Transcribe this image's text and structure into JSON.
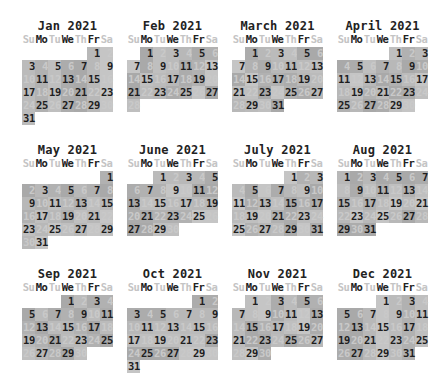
{
  "year": 2021,
  "weekday_labels": [
    "Su",
    "Mo",
    "Tu",
    "We",
    "Th",
    "Fr",
    "Sa"
  ],
  "weekday_emphasis": [
    false,
    true,
    false,
    true,
    false,
    true,
    false
  ],
  "colors": {
    "odd_day_text": "#1e1e1e",
    "even_day_text": "#c9c9c9",
    "cell_shades": [
      "#a9a9a9",
      "#b1b1b1",
      "#b8b8b8",
      "#bfbfbf",
      "#c5c5c5",
      "#acacac",
      "#bbbbbb"
    ]
  },
  "months": [
    {
      "title": "Jan 2021",
      "first_weekday": 5,
      "days": 31
    },
    {
      "title": "Feb 2021",
      "first_weekday": 1,
      "days": 28
    },
    {
      "title": "March 2021",
      "first_weekday": 1,
      "days": 31
    },
    {
      "title": "April 2021",
      "first_weekday": 4,
      "days": 30
    },
    {
      "title": "May 2021",
      "first_weekday": 6,
      "days": 31
    },
    {
      "title": "June 2021",
      "first_weekday": 2,
      "days": 30
    },
    {
      "title": "July 2021",
      "first_weekday": 4,
      "days": 31
    },
    {
      "title": "Aug 2021",
      "first_weekday": 0,
      "days": 31
    },
    {
      "title": "Sep 2021",
      "first_weekday": 3,
      "days": 30
    },
    {
      "title": "Oct 2021",
      "first_weekday": 5,
      "days": 31
    },
    {
      "title": "Nov 2021",
      "first_weekday": 1,
      "days": 30
    },
    {
      "title": "Dec 2021",
      "first_weekday": 3,
      "days": 31
    }
  ]
}
